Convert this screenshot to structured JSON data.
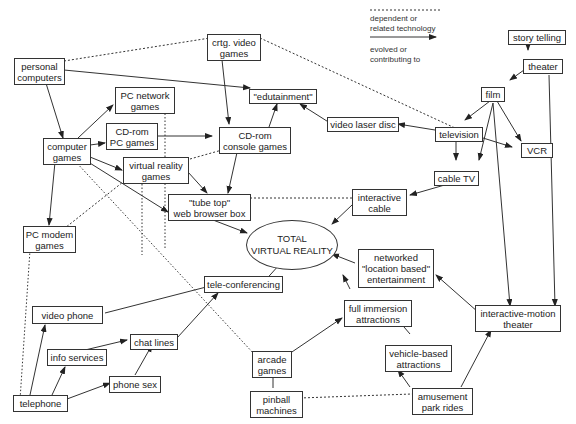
{
  "legend": {
    "dashed_label": "dependent or related technology",
    "dashed_line1": "dependent or",
    "dashed_line2": "related technology",
    "solid_line1": "evolved or",
    "solid_line2": "contributing to"
  },
  "center": {
    "line1": "TOTAL",
    "line2": "VIRTUAL REALITY"
  },
  "nodes": {
    "personal_computers": [
      "personal",
      "computers"
    ],
    "crtg_video_games": [
      "crtg. video",
      "games"
    ],
    "edutainment": [
      "\"edutainment\""
    ],
    "pc_network_games": [
      "PC network",
      "games"
    ],
    "cdrom_pc_games": [
      "CD-rom",
      "PC games"
    ],
    "computer_games": [
      "computer",
      "games"
    ],
    "cdrom_console_games": [
      "CD-rom",
      "console games"
    ],
    "video_laser_disc": [
      "video laser disc"
    ],
    "virtual_reality_games": [
      "virtual reality",
      "games"
    ],
    "tube_top": [
      "\"tube top\"",
      "web browser box"
    ],
    "pc_modem_games": [
      "PC modem",
      "games"
    ],
    "story_telling": [
      "story telling"
    ],
    "theater": [
      "theater"
    ],
    "film": [
      "film"
    ],
    "television": [
      "television"
    ],
    "vcr": [
      "VCR"
    ],
    "cable_tv": [
      "cable TV"
    ],
    "interactive_cable": [
      "interactive",
      "cable"
    ],
    "networked_lbe": [
      "networked",
      "\"location based\"",
      "entertainment"
    ],
    "tele_conferencing": [
      "tele-conferencing"
    ],
    "video_phone": [
      "video phone"
    ],
    "chat_lines": [
      "chat lines"
    ],
    "info_services": [
      "info services"
    ],
    "phone_sex": [
      "phone sex"
    ],
    "telephone": [
      "telephone"
    ],
    "full_immersion": [
      "full immersion",
      "attractions"
    ],
    "arcade_games": [
      "arcade",
      "games"
    ],
    "vehicle_based": [
      "vehicle-based",
      "attractions"
    ],
    "pinball": [
      "pinball",
      "machines"
    ],
    "amusement_park": [
      "amusement",
      "park rides"
    ],
    "interactive_motion": [
      "interactive-motion",
      "theater"
    ]
  },
  "colors": {
    "line": "#333333",
    "background": "#ffffff"
  }
}
